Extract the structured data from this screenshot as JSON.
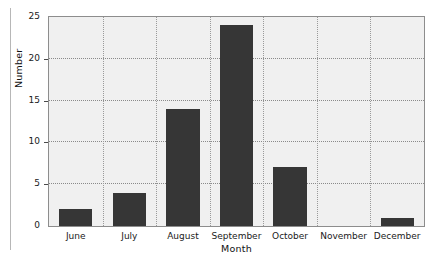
{
  "chart_data": {
    "type": "bar",
    "title": "",
    "subtitle": "",
    "xlabel": "Month",
    "ylabel": "Number",
    "categories": [
      "June",
      "July",
      "August",
      "September",
      "October",
      "November",
      "December"
    ],
    "values": [
      2,
      4,
      14,
      24,
      7,
      0,
      1
    ],
    "series": [
      {
        "name": "Number",
        "values": [
          2,
          4,
          14,
          24,
          7,
          0,
          1
        ]
      }
    ],
    "ylim": [
      0,
      25
    ],
    "yticks": [
      0,
      5,
      10,
      15,
      20,
      25
    ],
    "ytick_labels": [
      "0",
      "5",
      "10",
      "15",
      "20",
      "25"
    ],
    "grid": {
      "horizontal": true,
      "vertical": true,
      "style": "dotted"
    },
    "legend": {
      "visible": false,
      "position": "none",
      "entries": []
    },
    "annotations": [],
    "colors": {
      "bar_fill": "#363636",
      "plot_background": "#f0f0f0",
      "plot_border": "#8d8d8d",
      "gridline": "#8a8a8a",
      "axis_text": "#1a1a1a",
      "margin_rule": "#b7b7b7"
    }
  },
  "figure": {
    "axis_titles": {
      "x": "Month",
      "y": "Number"
    }
  }
}
